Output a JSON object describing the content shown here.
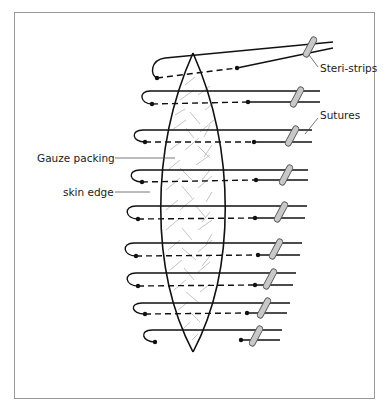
{
  "labels": {
    "steri_strips": "Steri-strips",
    "sutures": "Sutures",
    "gauze_packing": "Gauze packing",
    "skin_edge": "skin edge"
  },
  "colors": {
    "line": "#111111",
    "gauze": "#b5b5b5",
    "strip_fill": "#c8c8c8",
    "strip_stroke": "#555555",
    "leader": "#555555",
    "border": "#9a9a9a"
  }
}
